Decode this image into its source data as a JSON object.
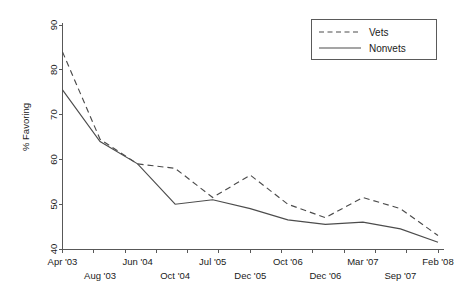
{
  "chart_data": {
    "type": "line",
    "title": "",
    "xlabel": "",
    "ylabel": "% Favoring",
    "ylim": [
      40,
      90
    ],
    "yticks": [
      40,
      50,
      60,
      70,
      80,
      90
    ],
    "ytick_labels": [
      "40",
      "50",
      "60",
      "70",
      "80",
      "90"
    ],
    "grid": false,
    "legend_position": "top-right",
    "categories": [
      "Apr '03",
      "Aug '03",
      "Jun '04",
      "Oct '04",
      "Jul '05",
      "Dec '05",
      "Oct '06",
      "Dec '06",
      "Mar '07",
      "Sep '07",
      "Feb '08"
    ],
    "xtick_labels": [
      "Apr '03",
      "Aug '03",
      "Jun '04",
      "Oct '04",
      "Jul '05",
      "Dec '05",
      "Oct '06",
      "Dec '06",
      "Mar '07",
      "Sep '07",
      "Feb '08"
    ],
    "series": [
      {
        "name": "Vets",
        "style": "dashed",
        "color": "#4c4c4c",
        "values": [
          84.0,
          64.5,
          59.0,
          58.0,
          51.5,
          56.5,
          50.0,
          47.0,
          51.5,
          49.0,
          43.0
        ]
      },
      {
        "name": "Nonvets",
        "style": "solid",
        "color": "#4c4c4c",
        "values": [
          75.5,
          64.0,
          59.0,
          50.0,
          51.0,
          49.0,
          46.5,
          45.5,
          46.0,
          44.5,
          41.5
        ]
      }
    ]
  },
  "legend": {
    "entries": [
      {
        "label": "Vets",
        "style": "dashed"
      },
      {
        "label": "Nonvets",
        "style": "solid"
      }
    ]
  },
  "axes": {
    "y_axis_label": "% Favoring"
  }
}
